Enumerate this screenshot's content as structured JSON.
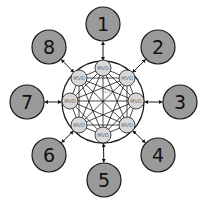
{
  "diagram": {
    "center_label": "LDN",
    "center": {
      "x": 103,
      "y": 102,
      "r": 41
    },
    "colors": {
      "outer_node_fill": "#9a9a9a",
      "mvd_fill": "#d8d8d8",
      "stroke": "#1a1a1a",
      "ring_fill": "#ffffff"
    },
    "outer_nodes": [
      {
        "label": "1",
        "x": 103,
        "y": 24
      },
      {
        "label": "2",
        "x": 158,
        "y": 47
      },
      {
        "label": "3",
        "x": 180,
        "y": 102
      },
      {
        "label": "4",
        "x": 158,
        "y": 155
      },
      {
        "label": "5",
        "x": 104,
        "y": 180
      },
      {
        "label": "6",
        "x": 49,
        "y": 155
      },
      {
        "label": "7",
        "x": 27,
        "y": 102
      },
      {
        "label": "8",
        "x": 49,
        "y": 47
      }
    ],
    "inner_nodes": [
      {
        "label": "MVD",
        "x": 103,
        "y": 68
      },
      {
        "label": "MVD",
        "x": 127,
        "y": 78
      },
      {
        "label": "MVD",
        "x": 136,
        "y": 101
      },
      {
        "label": "MVD",
        "x": 127,
        "y": 125
      },
      {
        "label": "MVD",
        "x": 103,
        "y": 135
      },
      {
        "label": "MVD",
        "x": 79,
        "y": 125
      },
      {
        "label": "MVD",
        "x": 70,
        "y": 101
      },
      {
        "label": "MVD",
        "x": 79,
        "y": 78
      }
    ]
  }
}
